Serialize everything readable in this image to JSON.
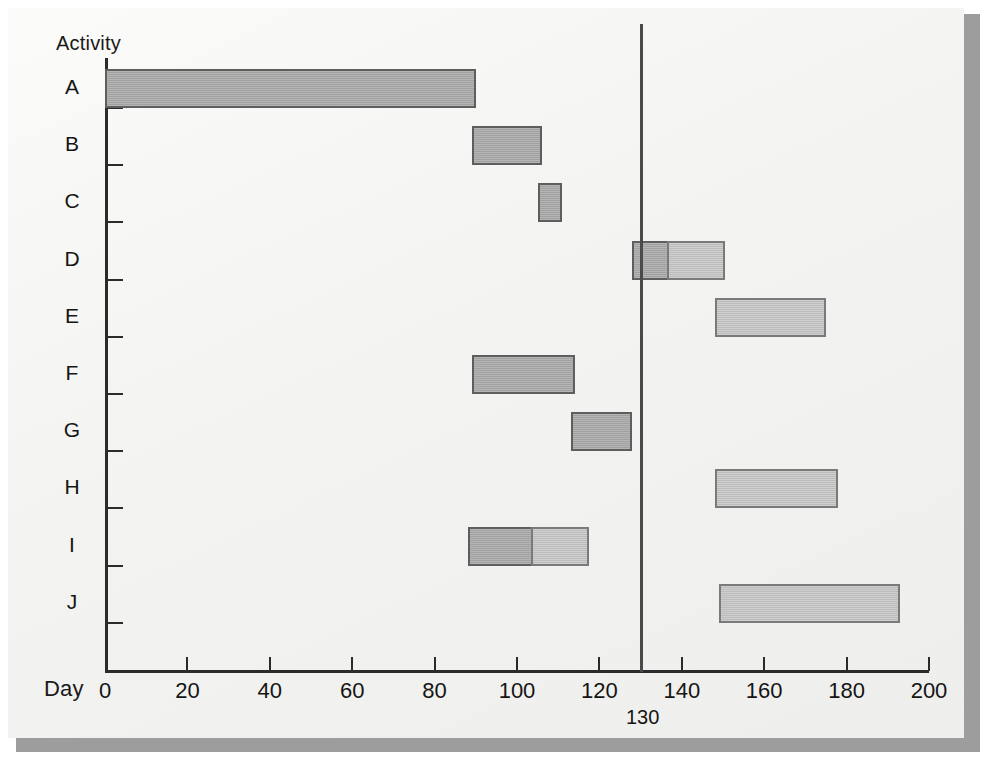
{
  "chart_data": {
    "type": "bar",
    "title": "",
    "subtitle": "",
    "xlabel": "Day",
    "ylabel": "Activity",
    "xlim": [
      0,
      200
    ],
    "ylim": [
      0,
      10
    ],
    "grid": false,
    "legend": null,
    "orientation": "horizontal",
    "x_ticks": [
      0,
      20,
      40,
      60,
      80,
      100,
      120,
      140,
      160,
      180,
      200
    ],
    "x_tick_labels": [
      "0",
      "20",
      "40",
      "60",
      "80",
      "100",
      "120",
      "140",
      "160",
      "180",
      "200"
    ],
    "categories": [
      "A",
      "B",
      "C",
      "D",
      "E",
      "F",
      "G",
      "H",
      "I",
      "J"
    ],
    "annotations": [
      {
        "type": "vertical-line",
        "label": "130",
        "value": 130
      }
    ],
    "bars": [
      {
        "category": "A",
        "segments": [
          {
            "kind": "main",
            "start": 0,
            "end": 90
          }
        ]
      },
      {
        "category": "B",
        "segments": [
          {
            "kind": "main",
            "start": 89,
            "end": 106
          }
        ]
      },
      {
        "category": "C",
        "segments": [
          {
            "kind": "main",
            "start": 105,
            "end": 111
          }
        ]
      },
      {
        "category": "D",
        "segments": [
          {
            "kind": "main",
            "start": 128,
            "end": 137
          },
          {
            "kind": "float",
            "start": 137,
            "end": 151
          }
        ]
      },
      {
        "category": "E",
        "segments": [
          {
            "kind": "float",
            "start": 148,
            "end": 175
          }
        ]
      },
      {
        "category": "F",
        "segments": [
          {
            "kind": "main",
            "start": 89,
            "end": 114
          }
        ]
      },
      {
        "category": "G",
        "segments": [
          {
            "kind": "main",
            "start": 113,
            "end": 128
          }
        ]
      },
      {
        "category": "H",
        "segments": [
          {
            "kind": "float",
            "start": 148,
            "end": 178
          }
        ]
      },
      {
        "category": "I",
        "segments": [
          {
            "kind": "main",
            "start": 88,
            "end": 104
          },
          {
            "kind": "float",
            "start": 104,
            "end": 118
          }
        ]
      },
      {
        "category": "J",
        "segments": [
          {
            "kind": "float",
            "start": 149,
            "end": 193
          }
        ]
      }
    ],
    "colors": {
      "bar_main": "#a9a9a9",
      "bar_float": "#c4c4c4",
      "bar_border": "#5e5e5e",
      "axis": "#2b2b2b",
      "reference_line": "#4a4a4a",
      "page_background": "#f4f4f2"
    }
  }
}
